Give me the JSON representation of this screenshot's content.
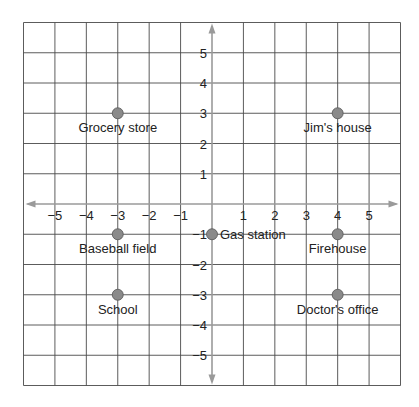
{
  "chart_data": {
    "type": "scatter",
    "title": "",
    "xlabel": "",
    "ylabel": "",
    "xlim": [
      -6,
      6
    ],
    "ylim": [
      -6,
      6
    ],
    "grid": true,
    "x_ticks": [
      "−5",
      "−4",
      "−3",
      "−2",
      "−1",
      "1",
      "2",
      "3",
      "4",
      "5"
    ],
    "x_tick_values": [
      -5,
      -4,
      -3,
      -2,
      -1,
      1,
      2,
      3,
      4,
      5
    ],
    "y_ticks": [
      "5",
      "4",
      "3",
      "2",
      "1",
      "−1",
      "−2",
      "−3",
      "−4",
      "−5"
    ],
    "y_tick_values": [
      5,
      4,
      3,
      2,
      1,
      -1,
      -2,
      -3,
      -4,
      -5
    ],
    "points": [
      {
        "label": "Grocery store",
        "x": -3,
        "y": 3,
        "label_pos": "below"
      },
      {
        "label": "Jim's house",
        "x": 4,
        "y": 3,
        "label_pos": "below"
      },
      {
        "label": "Baseball field",
        "x": -3,
        "y": -1,
        "label_pos": "below"
      },
      {
        "label": "Gas station",
        "x": 0,
        "y": -1,
        "label_pos": "right"
      },
      {
        "label": "Firehouse",
        "x": 4,
        "y": -1,
        "label_pos": "below"
      },
      {
        "label": "School",
        "x": -3,
        "y": -3,
        "label_pos": "below"
      },
      {
        "label": "Doctor's office",
        "x": 4,
        "y": -3,
        "label_pos": "below"
      }
    ],
    "colors": {
      "grid": "#4a4a4a",
      "axis": "#9a9a9a",
      "point_fill": "#8a8a8a",
      "point_stroke": "#555555"
    }
  }
}
